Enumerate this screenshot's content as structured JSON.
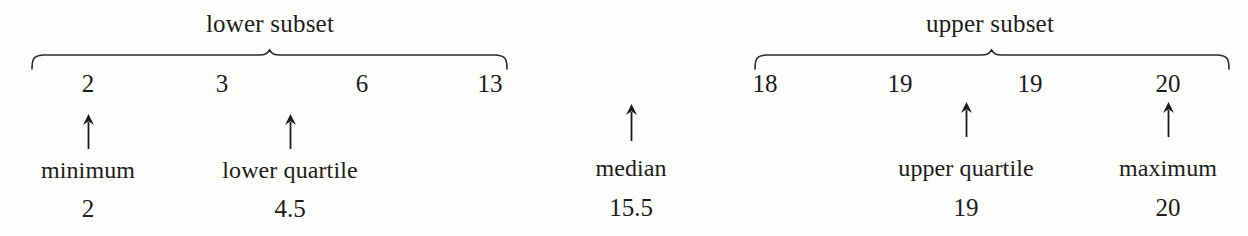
{
  "figure": {
    "type": "five-number-summary-annotation"
  },
  "groups": [
    {
      "id": "lower",
      "title": "lower subset",
      "title_x": 270,
      "brace": {
        "x1": 31,
        "x2": 508,
        "y": 50,
        "height": 17
      },
      "data": [
        {
          "value": "2",
          "x": 88
        },
        {
          "value": "3",
          "x": 222
        },
        {
          "value": "6",
          "x": 362
        },
        {
          "value": "13",
          "x": 490
        }
      ]
    },
    {
      "id": "upper",
      "title": "upper subset",
      "title_x": 990,
      "brace": {
        "x1": 754,
        "x2": 1230,
        "y": 50,
        "height": 17
      },
      "data": [
        {
          "value": "18",
          "x": 765
        },
        {
          "value": "19",
          "x": 900
        },
        {
          "value": "19",
          "x": 1030
        },
        {
          "value": "20",
          "x": 1168
        }
      ]
    }
  ],
  "annotations": [
    {
      "id": "minimum",
      "label": "minimum",
      "value": "2",
      "arrow_x": 88,
      "arrow_top": 114,
      "arrow_height": 35,
      "label_x": 88,
      "label_y": 157,
      "value_x": 88,
      "value_y": 195
    },
    {
      "id": "lower-quartile",
      "label": "lower quartile",
      "value": "4.5",
      "arrow_x": 290,
      "arrow_top": 114,
      "arrow_height": 35,
      "label_x": 290,
      "label_y": 157,
      "value_x": 290,
      "value_y": 195
    },
    {
      "id": "median",
      "label": "median",
      "value": "15.5",
      "arrow_x": 631,
      "arrow_top": 104,
      "arrow_height": 37,
      "label_x": 631,
      "label_y": 155,
      "value_x": 631,
      "value_y": 194
    },
    {
      "id": "upper-quartile",
      "label": "upper quartile",
      "value": "19",
      "arrow_x": 966,
      "arrow_top": 102,
      "arrow_height": 35,
      "label_x": 966,
      "label_y": 155,
      "value_x": 966,
      "value_y": 194
    },
    {
      "id": "maximum",
      "label": "maximum",
      "value": "20",
      "arrow_x": 1168,
      "arrow_top": 102,
      "arrow_height": 35,
      "label_x": 1168,
      "label_y": 155,
      "value_x": 1168,
      "value_y": 194
    }
  ],
  "style": {
    "ink": "#1c1c1c",
    "paper": "#fdfdfb"
  }
}
